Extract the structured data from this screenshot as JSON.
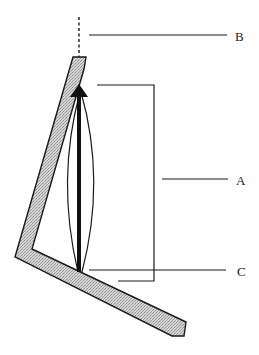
{
  "diagram": {
    "labels": {
      "a": "A",
      "b": "B",
      "c": "C"
    },
    "colors": {
      "stroke": "#1a1a1a",
      "plate_fill": "#c8c8c8",
      "background": "#ffffff"
    },
    "components": [
      {
        "id": "plate",
        "description": "angled hatched plate (V-shaped bent strip)"
      },
      {
        "id": "arrow",
        "description": "thick vertical upward arrow"
      },
      {
        "id": "lens",
        "description": "lens-shaped curved outline around arrow"
      },
      {
        "id": "bracket",
        "description": "bracket spanning arrow length, pointed to by A"
      },
      {
        "id": "dashed-extension",
        "description": "dashed vertical line above plate tip, pointed to by B"
      },
      {
        "id": "base-pointer",
        "description": "leader line at arrow base, pointed to by C"
      }
    ]
  }
}
